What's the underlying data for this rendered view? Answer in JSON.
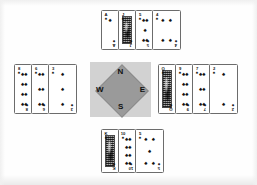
{
  "diagram": {
    "type": "bridge-hand-compass-diagram",
    "suit_symbol": "♠",
    "suit_name": "spades",
    "ink_color": "#111111",
    "card_face_color": "#ffffff",
    "card_border_color": "#6c6c6c",
    "compass_panel_color": "#d2d2d2",
    "compass_diamond_color": "#9a9a9a"
  },
  "compass": {
    "north_label": "N",
    "south_label": "S",
    "west_label": "W",
    "east_label": "E"
  },
  "hands": {
    "north": {
      "position_label": "North",
      "cards": [
        {
          "rank": "A",
          "suit": "♠",
          "type": "spot",
          "pips": 1,
          "clipped": true
        },
        {
          "rank": "J",
          "suit": "♠",
          "type": "face",
          "pips": 0,
          "clipped": true
        },
        {
          "rank": "5",
          "suit": "♠",
          "type": "spot",
          "pips": 5,
          "clipped": true
        },
        {
          "rank": "4",
          "suit": "♠",
          "type": "spot",
          "pips": 4,
          "clipped": false
        }
      ]
    },
    "west": {
      "position_label": "West",
      "cards": [
        {
          "rank": "8",
          "suit": "♠",
          "type": "spot",
          "pips": 8,
          "clipped": true
        },
        {
          "rank": "6",
          "suit": "♠",
          "type": "spot",
          "pips": 6,
          "clipped": true
        },
        {
          "rank": "3",
          "suit": "♠",
          "type": "spot",
          "pips": 3,
          "clipped": false
        }
      ]
    },
    "east": {
      "position_label": "East",
      "cards": [
        {
          "rank": "Q",
          "suit": "♠",
          "type": "face",
          "pips": 0,
          "clipped": true
        },
        {
          "rank": "9",
          "suit": "♠",
          "type": "spot",
          "pips": 8,
          "clipped": true
        },
        {
          "rank": "7",
          "suit": "♠",
          "type": "spot",
          "pips": 6,
          "clipped": true
        },
        {
          "rank": "2",
          "suit": "♠",
          "type": "spot",
          "pips": 2,
          "clipped": false
        }
      ]
    },
    "south": {
      "position_label": "South",
      "cards": [
        {
          "rank": "K",
          "suit": "♠",
          "type": "face",
          "pips": 0,
          "clipped": true
        },
        {
          "rank": "10",
          "suit": "♠",
          "type": "spot",
          "pips": 8,
          "clipped": true
        },
        {
          "rank": "5",
          "suit": "♠",
          "type": "spot",
          "pips": 5,
          "clipped": false
        }
      ]
    }
  }
}
